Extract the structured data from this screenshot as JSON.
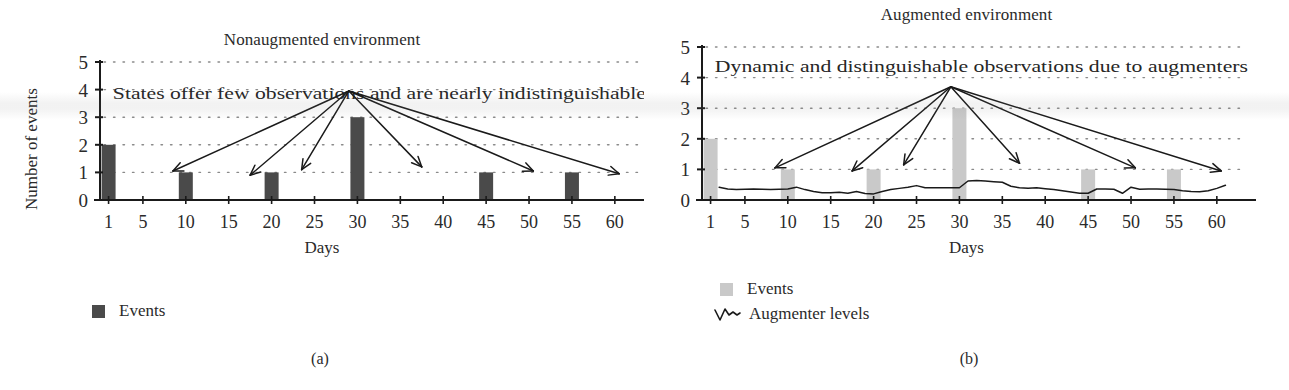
{
  "figure": {
    "panels": [
      {
        "id": "a",
        "subcaption": "(a)",
        "title": "Nonaugmented environment",
        "annotation": "States offer few observations and are nearly indistinguishable",
        "bar_color": "#4a4a4a",
        "legend": [
          {
            "icon": "filled-square",
            "label": "Events",
            "color": "#4a4a4a"
          }
        ]
      },
      {
        "id": "b",
        "subcaption": "(b)",
        "title": "Augmented environment",
        "annotation": "Dynamic and distinguishable observations due to augmenters",
        "bar_color": "#c9c9c9",
        "legend": [
          {
            "icon": "filled-square",
            "label": "Events",
            "color": "#c9c9c9"
          },
          {
            "icon": "squiggle-line",
            "label": "Augmenter levels",
            "color": "#1a1a1a"
          }
        ]
      }
    ]
  },
  "chart_data": [
    {
      "type": "bar",
      "title": "Nonaugmented environment",
      "xlabel": "Days",
      "ylabel": "Number of events",
      "xlim": [
        0,
        62
      ],
      "ylim": [
        0,
        5
      ],
      "xticks": [
        1,
        5,
        10,
        15,
        20,
        25,
        30,
        35,
        40,
        45,
        50,
        55,
        60
      ],
      "yticks": [
        0,
        1,
        2,
        3,
        4,
        5
      ],
      "grid": "dotted-horizontal",
      "legend_position": "below-left",
      "series": [
        {
          "name": "Events",
          "color": "#4a4a4a",
          "x": [
            1,
            10,
            20,
            30,
            45,
            55
          ],
          "values": [
            2,
            1,
            1,
            3,
            1,
            1
          ]
        }
      ],
      "annotations": [
        {
          "text": "States offer few observations and are nearly indistinguishable",
          "x": 1.5,
          "y": 4.45
        }
      ],
      "arrows": {
        "origin": {
          "x": 29,
          "y": 3.95
        },
        "tips": [
          {
            "x": 8.5,
            "y": 1.05
          },
          {
            "x": 17.5,
            "y": 0.9
          },
          {
            "x": 23.5,
            "y": 1.1
          },
          {
            "x": 37.5,
            "y": 1.2
          },
          {
            "x": 50.5,
            "y": 1.05
          },
          {
            "x": 60.5,
            "y": 0.95
          }
        ]
      }
    },
    {
      "type": "bar+line",
      "title": "Augmented environment",
      "xlabel": "Days",
      "ylabel": "Number of events",
      "xlim": [
        0,
        62
      ],
      "ylim": [
        0,
        5
      ],
      "xticks": [
        1,
        5,
        10,
        15,
        20,
        25,
        30,
        35,
        40,
        45,
        50,
        55,
        60
      ],
      "yticks": [
        0,
        1,
        2,
        3,
        4,
        5
      ],
      "grid": "dotted-horizontal",
      "legend_position": "below-left",
      "series": [
        {
          "name": "Events",
          "type": "bar",
          "color": "#c9c9c9",
          "x": [
            1,
            10,
            20,
            30,
            45,
            55
          ],
          "values": [
            2,
            1,
            1,
            3,
            1,
            1
          ]
        },
        {
          "name": "Augmenter levels",
          "type": "line",
          "color": "#1a1a1a",
          "x": [
            2,
            3,
            4,
            5,
            6,
            7,
            8,
            9,
            10,
            11,
            12,
            13,
            14,
            15,
            16,
            17,
            18,
            19,
            20,
            21,
            22,
            23,
            24,
            25,
            26,
            27,
            28,
            29,
            30,
            31,
            32,
            33,
            34,
            35,
            36,
            37,
            38,
            39,
            40,
            41,
            42,
            43,
            44,
            45,
            46,
            47,
            48,
            49,
            50,
            51,
            52,
            53,
            54,
            55,
            56,
            57,
            58,
            59,
            60,
            61
          ],
          "values": [
            0.42,
            0.36,
            0.34,
            0.35,
            0.36,
            0.35,
            0.34,
            0.35,
            0.36,
            0.42,
            0.34,
            0.28,
            0.24,
            0.24,
            0.25,
            0.22,
            0.28,
            0.21,
            0.2,
            0.28,
            0.34,
            0.38,
            0.42,
            0.47,
            0.4,
            0.4,
            0.4,
            0.4,
            0.4,
            0.62,
            0.64,
            0.62,
            0.6,
            0.58,
            0.45,
            0.4,
            0.38,
            0.4,
            0.37,
            0.34,
            0.3,
            0.26,
            0.22,
            0.22,
            0.36,
            0.36,
            0.35,
            0.22,
            0.42,
            0.35,
            0.36,
            0.36,
            0.35,
            0.34,
            0.3,
            0.28,
            0.27,
            0.3,
            0.38,
            0.48
          ]
        }
      ],
      "annotations": [
        {
          "text": "Dynamic and distinguishable observations due to augmenters",
          "x": 1.5,
          "y": 4.4
        }
      ],
      "arrows": {
        "origin": {
          "x": 29,
          "y": 3.7
        },
        "tips": [
          {
            "x": 8.5,
            "y": 1.05
          },
          {
            "x": 17.5,
            "y": 0.95
          },
          {
            "x": 23.5,
            "y": 1.15
          },
          {
            "x": 37,
            "y": 1.2
          },
          {
            "x": 50.5,
            "y": 1.05
          },
          {
            "x": 60.5,
            "y": 0.95
          }
        ]
      }
    }
  ]
}
